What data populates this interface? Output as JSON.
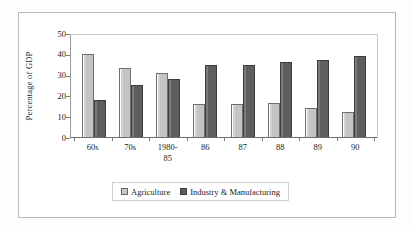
{
  "chart_data": {
    "type": "bar",
    "title": "",
    "xlabel": "",
    "ylabel": "Percentage of GDP",
    "categories": [
      "60s",
      "70s",
      "1980-\n85",
      "86",
      "87",
      "88",
      "89",
      "90"
    ],
    "series": [
      {
        "name": "Agriculture",
        "values": [
          40,
          33,
          31,
          16,
          16,
          16.3,
          14,
          12
        ]
      },
      {
        "name": "Industry & Manufacturing",
        "values": [
          18,
          25,
          28,
          34.5,
          34.5,
          36,
          37,
          39
        ]
      }
    ],
    "ylim": [
      0,
      50
    ],
    "yticks": [
      0,
      10,
      20,
      30,
      40,
      50
    ],
    "ytick_labels": [
      "0",
      "10",
      "20",
      "30",
      "40",
      "50"
    ],
    "grid": false,
    "legend_position": "bottom",
    "colors": {
      "agriculture": "#c4c4c4",
      "industry": "#5e5e5e",
      "axis": "#6f6f6f",
      "frame": "#b9b9b9",
      "text": "#1c1c1c",
      "background": "#ffffff"
    }
  }
}
